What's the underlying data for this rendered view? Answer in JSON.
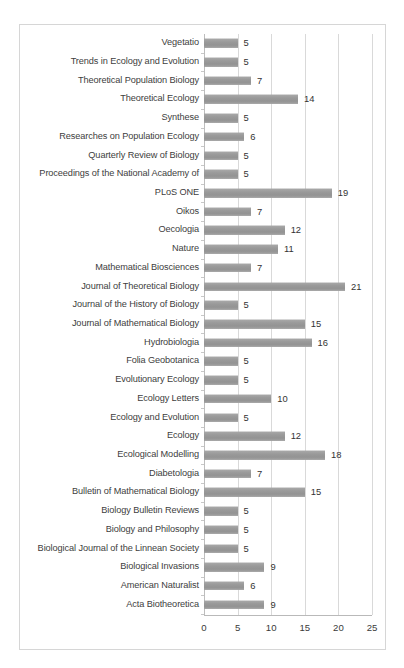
{
  "chart_data": {
    "type": "bar",
    "orientation": "horizontal",
    "title": "",
    "subtitle": "",
    "xlabel": "",
    "ylabel": "",
    "xlim": [
      0,
      25
    ],
    "xticks": [
      0,
      5,
      10,
      15,
      20,
      25
    ],
    "grid": "vertical",
    "legend": "none",
    "show_value_labels": true,
    "bar_color": "#9c9c9c",
    "gridline_color": "#d9d9d9",
    "axis_color": "#b9b9b9",
    "frame_color": "#d6d6d6",
    "categories": [
      "Vegetatio",
      "Trends in Ecology and Evolution",
      "Theoretical Population Biology",
      "Theoretical Ecology",
      "Synthese",
      "Researches on Population Ecology",
      "Quarterly Review of Biology",
      "Proceedings of the National Academy of",
      "PLoS ONE",
      "Oikos",
      "Oecologia",
      "Nature",
      "Mathematical Biosciences",
      "Journal of Theoretical Biology",
      "Journal of the History of Biology",
      "Journal of Mathematical Biology",
      "Hydrobiologia",
      "Folia Geobotanica",
      "Evolutionary Ecology",
      "Ecology Letters",
      "Ecology and Evolution",
      "Ecology",
      "Ecological Modelling",
      "Diabetologia",
      "Bulletin of Mathematical Biology",
      "Biology Bulletin Reviews",
      "Biology and Philosophy",
      "Biological Journal of the Linnean Society",
      "Biological Invasions",
      "American Naturalist",
      "Acta Biotheoretica"
    ],
    "values": [
      5,
      5,
      7,
      14,
      5,
      6,
      5,
      5,
      19,
      7,
      12,
      11,
      7,
      21,
      5,
      15,
      16,
      5,
      5,
      10,
      5,
      12,
      18,
      7,
      15,
      5,
      5,
      5,
      9,
      6,
      9
    ]
  }
}
